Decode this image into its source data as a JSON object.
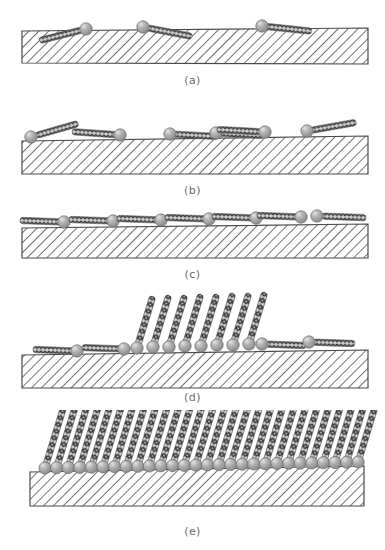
{
  "figure": {
    "background_color": "#ffffff",
    "label_color": "#6b6b6b"
  },
  "style": {
    "substrate_fill": "#ffffff",
    "substrate_stroke": "#4a4a4a",
    "hatch_color": "#5a5a5a",
    "chain_dark": "#3c3c3c",
    "chain_light": "#c9c9c9",
    "head_fill": "#9a9a9a",
    "head_highlight": "#d9d9d9",
    "head_stroke": "#6a6a6a"
  },
  "panels": [
    {
      "id": "a",
      "label": "(a)",
      "caption": "Sparse physisorption: isolated molecules lie nearly flat on the substrate",
      "label_y": 78,
      "substrate": {
        "x0": 22,
        "y_top_left": 31,
        "x1": 368,
        "y_top_right": 28,
        "height_left": 32,
        "height_right": 36
      },
      "molecule_count": 3,
      "orientation": "lying-down",
      "molecules": [
        {
          "head_x": 86,
          "head_y": 29,
          "tail_angle_deg": -14,
          "tail_length": 44,
          "tail_dir": "left"
        },
        {
          "head_x": 143,
          "head_y": 27,
          "tail_angle_deg": 11,
          "tail_length": 46,
          "tail_dir": "right"
        },
        {
          "head_x": 262,
          "head_y": 26,
          "tail_angle_deg": 6,
          "tail_length": 46,
          "tail_dir": "right"
        }
      ]
    },
    {
      "id": "b",
      "label": "(b)",
      "caption": "Increasing coverage: more molecules adsorb, still lying down",
      "label_y": 188,
      "substrate": {
        "x0": 22,
        "y_top_left": 141,
        "x1": 368,
        "y_top_right": 136,
        "height_left": 33,
        "height_right": 38
      },
      "molecule_count": 6,
      "orientation": "lying-down",
      "molecules": [
        {
          "head_x": 31,
          "head_y": 137,
          "tail_angle_deg": -16,
          "tail_length": 44,
          "tail_dir": "right"
        },
        {
          "head_x": 120,
          "head_y": 135,
          "tail_angle_deg": 4,
          "tail_length": 44,
          "tail_dir": "left"
        },
        {
          "head_x": 170,
          "head_y": 134,
          "tail_angle_deg": 3,
          "tail_length": 44,
          "tail_dir": "right"
        },
        {
          "head_x": 216,
          "head_y": 133,
          "tail_angle_deg": 3,
          "tail_length": 44,
          "tail_dir": "right"
        },
        {
          "head_x": 265,
          "head_y": 132,
          "tail_angle_deg": 3,
          "tail_length": 44,
          "tail_dir": "left"
        },
        {
          "head_x": 307,
          "head_y": 131,
          "tail_angle_deg": -10,
          "tail_length": 46,
          "tail_dir": "right"
        }
      ]
    },
    {
      "id": "c",
      "label": "(c)",
      "caption": "Complete lying-down phase: saturated low-density striped monolayer",
      "label_y": 272,
      "substrate": {
        "x0": 22,
        "y_top_left": 228,
        "x1": 368,
        "y_top_right": 224,
        "height_left": 30,
        "height_right": 34
      },
      "molecule_count": 7,
      "orientation": "lying-down",
      "molecules": [
        {
          "head_x": 64,
          "head_y": 222,
          "tail_angle_deg": 2,
          "tail_length": 42,
          "tail_dir": "left"
        },
        {
          "head_x": 113,
          "head_y": 221,
          "tail_angle_deg": 2,
          "tail_length": 42,
          "tail_dir": "left"
        },
        {
          "head_x": 161,
          "head_y": 220,
          "tail_angle_deg": 2,
          "tail_length": 42,
          "tail_dir": "left"
        },
        {
          "head_x": 209,
          "head_y": 219,
          "tail_angle_deg": 2,
          "tail_length": 42,
          "tail_dir": "left"
        },
        {
          "head_x": 256,
          "head_y": 218,
          "tail_angle_deg": 2,
          "tail_length": 42,
          "tail_dir": "left"
        },
        {
          "head_x": 301,
          "head_y": 217,
          "tail_angle_deg": 2,
          "tail_length": 42,
          "tail_dir": "left"
        },
        {
          "head_x": 317,
          "head_y": 216,
          "tail_angle_deg": 2,
          "tail_length": 44,
          "tail_dir": "right"
        }
      ]
    },
    {
      "id": "d",
      "label": "(d)",
      "caption": "Nucleation: an island of upright, tilted molecules grows among lying-down ones",
      "label_y": 396,
      "substrate": {
        "x0": 22,
        "y_top_left": 355,
        "x1": 368,
        "y_top_right": 350,
        "height_left": 38,
        "height_right": 42
      },
      "standing_count": 8,
      "lying_count": 6,
      "standing_tilt_deg": 17,
      "standing_chain_length": 52,
      "standing_molecules": [
        {
          "head_x": 137,
          "head_y": 348
        },
        {
          "head_x": 153,
          "head_y": 347
        },
        {
          "head_x": 169,
          "head_y": 347
        },
        {
          "head_x": 185,
          "head_y": 346
        },
        {
          "head_x": 201,
          "head_y": 346
        },
        {
          "head_x": 217,
          "head_y": 345
        },
        {
          "head_x": 233,
          "head_y": 345
        },
        {
          "head_x": 249,
          "head_y": 344
        }
      ],
      "lying_molecules": [
        {
          "head_x": 77,
          "head_y": 351,
          "tail_angle_deg": 2,
          "tail_length": 42,
          "tail_dir": "left"
        },
        {
          "head_x": 124,
          "head_y": 349,
          "tail_angle_deg": 2,
          "tail_length": 40,
          "tail_dir": "left"
        },
        {
          "head_x": 262,
          "head_y": 344,
          "tail_angle_deg": 2,
          "tail_length": 40,
          "tail_dir": "right"
        },
        {
          "head_x": 309,
          "head_y": 342,
          "tail_angle_deg": 2,
          "tail_length": 42,
          "tail_dir": "right"
        }
      ]
    },
    {
      "id": "e",
      "label": "(e)",
      "caption": "Final densely packed standing-up phase: complete tilted self-assembled monolayer",
      "label_y": 525,
      "substrate": {
        "x0": 30,
        "y_top_left": 472,
        "x1": 364,
        "y_top_right": 466,
        "height_left": 34,
        "height_right": 40
      },
      "standing_count": 28,
      "standing_tilt_deg": 17,
      "standing_chain_length": 62,
      "first_head_x": 45,
      "head_spacing": 11.6,
      "head_y_left": 468,
      "head_y_right": 462
    }
  ]
}
